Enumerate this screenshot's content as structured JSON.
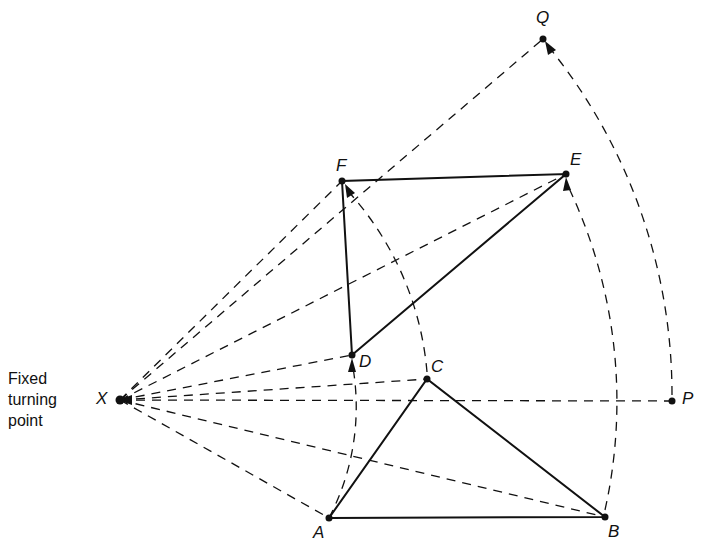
{
  "diagram": {
    "type": "rotation about a fixed point",
    "caption_lines": [
      "Fixed",
      "turning",
      "point"
    ],
    "points": {
      "X": {
        "label": "X",
        "x": 120,
        "y": 400
      },
      "A": {
        "label": "A",
        "x": 329,
        "y": 518
      },
      "B": {
        "label": "B",
        "x": 605,
        "y": 517
      },
      "C": {
        "label": "C",
        "x": 427,
        "y": 379
      },
      "D": {
        "label": "D",
        "x": 352,
        "y": 355
      },
      "E": {
        "label": "E",
        "x": 566,
        "y": 174
      },
      "F": {
        "label": "F",
        "x": 342,
        "y": 181
      },
      "P": {
        "label": "P",
        "x": 672,
        "y": 401
      },
      "Q": {
        "label": "Q",
        "x": 543,
        "y": 39
      }
    },
    "solid_shapes": [
      {
        "name": "original-triangle",
        "vertices": [
          "A",
          "B",
          "C"
        ]
      },
      {
        "name": "image-triangle",
        "vertices": [
          "D",
          "E",
          "F"
        ]
      }
    ],
    "dashed_rays_from": "X",
    "dashed_rays_to": [
      "A",
      "B",
      "C",
      "D",
      "E",
      "F",
      "P",
      "Q"
    ],
    "rotation_arcs": [
      {
        "from": "A",
        "to": "D"
      },
      {
        "from": "C",
        "to": "F"
      },
      {
        "from": "B",
        "to": "E"
      },
      {
        "from": "P",
        "to": "Q"
      }
    ],
    "colors": {
      "ink": "#111111",
      "background": "#ffffff"
    }
  }
}
